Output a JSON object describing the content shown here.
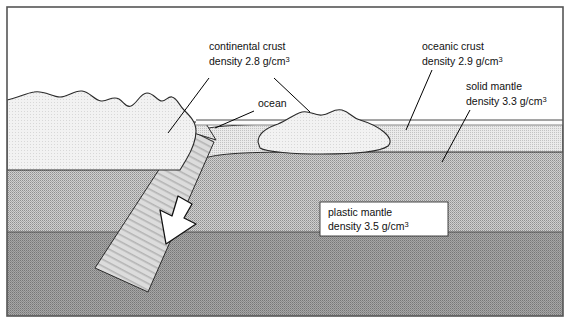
{
  "figure": {
    "title_visible": false,
    "border_color": "#555555",
    "background": "#ffffff"
  },
  "labels": {
    "continental_crust": {
      "line1": "continental crust",
      "line2_prefix": "density 2.8 g/cm",
      "line2_sup": "3"
    },
    "oceanic_crust": {
      "line1": "oceanic crust",
      "line2_prefix": "density 2.9 g/cm",
      "line2_sup": "3"
    },
    "solid_mantle": {
      "line1": "solid mantle",
      "line2_prefix": "density 3.3 g/cm",
      "line2_sup": "3"
    },
    "plastic_mantle": {
      "line1": "plastic mantle",
      "line2_prefix": "density 3.5 g/cm",
      "line2_sup": "3"
    },
    "ocean": {
      "text": "ocean"
    }
  },
  "layers": [
    {
      "name": "continental-crust",
      "label": "continental crust",
      "density": "2.8 g/cm3",
      "fill": "#f0f0f0"
    },
    {
      "name": "oceanic-crust",
      "label": "oceanic crust",
      "density": "2.9 g/cm3",
      "fill": "#e2e2e2"
    },
    {
      "name": "solid-mantle",
      "label": "solid mantle",
      "density": "3.3 g/cm3",
      "fill": "#b8b8b8"
    },
    {
      "name": "plastic-mantle",
      "label": "plastic mantle",
      "density": "3.5 g/cm3",
      "fill": "#9a9a9a"
    },
    {
      "name": "ocean-water",
      "label": "ocean",
      "density": "",
      "fill": "#f8f8f8"
    }
  ],
  "annotations": {
    "subduction_arrow": {
      "name": "subduction-direction-arrow",
      "direction": "down-left",
      "fill": "#ffffff",
      "stroke": "#000000"
    }
  }
}
